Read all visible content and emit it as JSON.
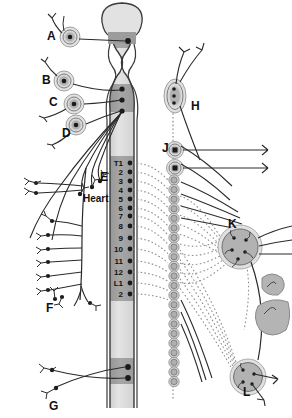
{
  "figure": {
    "background_color": "#ffffff",
    "line_color": "#2a2a2a",
    "ganglion_fill": "#b0b0b0",
    "ganglion_halo": "#d6d6d6",
    "cord_light": "#dcdcdc",
    "cord_mid": "#c9c9c9",
    "cord_dark": "#9a9a9a",
    "cord_outline": "#3a3a3a",
    "dotted_color": "#8c8c8c",
    "organ_fill": "#b4b4b4"
  },
  "left_labels": [
    {
      "id": "A",
      "text": "A",
      "x": 47,
      "y": 40
    },
    {
      "id": "B",
      "text": "B",
      "x": 42,
      "y": 84
    },
    {
      "id": "C",
      "text": "C",
      "x": 49,
      "y": 106
    },
    {
      "id": "D",
      "text": "D",
      "x": 62,
      "y": 137
    },
    {
      "id": "E",
      "text": "E",
      "x": 100,
      "y": 181
    },
    {
      "id": "F",
      "text": "F",
      "x": 46,
      "y": 312
    },
    {
      "id": "G",
      "text": "G",
      "x": 49,
      "y": 410
    }
  ],
  "right_labels": [
    {
      "id": "H",
      "text": "H",
      "x": 191,
      "y": 110
    },
    {
      "id": "J",
      "text": "J",
      "x": 162,
      "y": 152
    },
    {
      "id": "K",
      "text": "K",
      "x": 228,
      "y": 228
    },
    {
      "id": "L",
      "text": "L",
      "x": 243,
      "y": 396
    }
  ],
  "organ_labels": [
    {
      "id": "heart",
      "text": "Heart",
      "x": 83,
      "y": 202
    }
  ],
  "vertebral_levels": [
    {
      "label": "T1",
      "y": 163
    },
    {
      "label": "2",
      "y": 172
    },
    {
      "label": "3",
      "y": 181
    },
    {
      "label": "4",
      "y": 190
    },
    {
      "label": "5",
      "y": 199
    },
    {
      "label": "6",
      "y": 208
    },
    {
      "label": "7",
      "y": 216
    },
    {
      "label": "8",
      "y": 226
    },
    {
      "label": "9",
      "y": 238
    },
    {
      "label": "10",
      "y": 249
    },
    {
      "label": "11",
      "y": 261
    },
    {
      "label": "12",
      "y": 272
    },
    {
      "label": "L1",
      "y": 283
    },
    {
      "label": "2",
      "y": 294
    }
  ],
  "cord_segments": [
    {
      "name": "brainstem-upper",
      "shade": "light"
    },
    {
      "name": "cranial-nucleus-band",
      "shade": "dark"
    },
    {
      "name": "pons-region",
      "shade": "light"
    },
    {
      "name": "medulla-band",
      "shade": "dark"
    },
    {
      "name": "cervical-cord",
      "shade": "light"
    },
    {
      "name": "thoracolumbar-band",
      "shade": "dark"
    },
    {
      "name": "lower-cord",
      "shade": "light"
    },
    {
      "name": "sacral-band",
      "shade": "dark"
    },
    {
      "name": "cord-terminal",
      "shade": "light"
    }
  ],
  "chain_ganglia_count": 22,
  "preganglionic_roots_left": 4,
  "sacral_roots_left": 2,
  "caption": ""
}
